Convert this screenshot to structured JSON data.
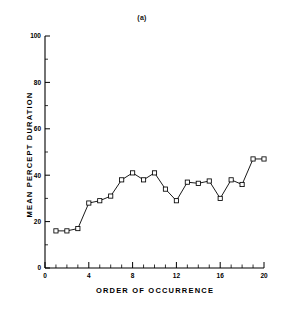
{
  "figure": {
    "panel_label": "(a)",
    "background_color": "#ffffff",
    "line_color": "#000000",
    "marker_color": "#ffffff",
    "marker_edge_color": "#000000"
  },
  "chart_data": {
    "type": "line",
    "title": "(a)",
    "subtitle": "",
    "xlabel": "ORDER  OF  OCCURRENCE",
    "ylabel": "MEAN  PERCEPT  DURATION",
    "xlim": [
      0,
      20
    ],
    "ylim": [
      0,
      100
    ],
    "grid": false,
    "legend": null,
    "marker": "open-square",
    "x_ticks": [
      0,
      4,
      8,
      12,
      16,
      20
    ],
    "x_tick_labels": [
      "0",
      "4",
      "8",
      "12",
      "16",
      "20"
    ],
    "x_minor_ticks": [
      1,
      2,
      3,
      5,
      6,
      7,
      9,
      10,
      11,
      13,
      14,
      15,
      17,
      18,
      19
    ],
    "y_ticks": [
      0,
      20,
      40,
      60,
      80,
      100
    ],
    "y_tick_labels": [
      "0",
      "20",
      "40",
      "60",
      "80",
      "100"
    ],
    "y_minor_ticks": [
      10,
      30,
      50,
      70,
      90
    ],
    "x": [
      1,
      2,
      3,
      4,
      5,
      6,
      7,
      8,
      9,
      10,
      11,
      12,
      13,
      14,
      15,
      16,
      17,
      18,
      19,
      20
    ],
    "values": [
      16,
      16,
      17,
      28,
      29,
      31,
      38,
      41,
      38,
      41,
      34,
      29,
      37,
      36.5,
      37.5,
      30,
      38,
      36,
      47,
      47
    ],
    "series": [
      {
        "name": "mean percept duration",
        "values": [
          16,
          16,
          17,
          28,
          29,
          31,
          38,
          41,
          38,
          41,
          34,
          29,
          37,
          36.5,
          37.5,
          30,
          38,
          36,
          47,
          47
        ]
      }
    ]
  }
}
